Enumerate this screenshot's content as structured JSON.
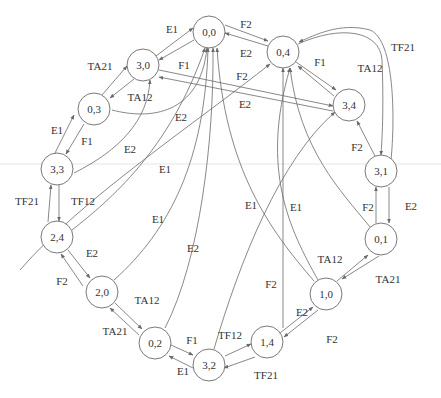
{
  "diagram": {
    "type": "state-transition-graph",
    "node_radius": 16,
    "colors": {
      "stroke": "#6a6a6a",
      "text": "#333333",
      "background": "#ffffff"
    },
    "nodes": [
      {
        "id": "0,0",
        "label": "0,0",
        "x": 209,
        "y": 32
      },
      {
        "id": "0,4",
        "label": "0,4",
        "x": 283,
        "y": 52
      },
      {
        "id": "3,0",
        "label": "3,0",
        "x": 143,
        "y": 65
      },
      {
        "id": "0,3",
        "label": "0,3",
        "x": 94,
        "y": 109
      },
      {
        "id": "3,4",
        "label": "3,4",
        "x": 349,
        "y": 105
      },
      {
        "id": "3,3",
        "label": "3,3",
        "x": 57,
        "y": 169
      },
      {
        "id": "3,1",
        "label": "3,1",
        "x": 381,
        "y": 171
      },
      {
        "id": "2,4",
        "label": "2,4",
        "x": 57,
        "y": 237
      },
      {
        "id": "0,1",
        "label": "0,1",
        "x": 381,
        "y": 239
      },
      {
        "id": "2,0",
        "label": "2,0",
        "x": 102,
        "y": 292
      },
      {
        "id": "1,0",
        "label": "1,0",
        "x": 326,
        "y": 294
      },
      {
        "id": "0,2",
        "label": "0,2",
        "x": 155,
        "y": 343
      },
      {
        "id": "1,4",
        "label": "1,4",
        "x": 267,
        "y": 342
      },
      {
        "id": "3,2",
        "label": "3,2",
        "x": 209,
        "y": 365
      }
    ],
    "edges": [
      {
        "from": "3,0",
        "to": "0,0",
        "label": "E1",
        "path": "M156,56 L193,28",
        "lx": 172,
        "ly": 29
      },
      {
        "from": "0,0",
        "to": "3,0",
        "label": "",
        "path": "M194,40 L159,60"
      },
      {
        "from": "0,0",
        "to": "0,4",
        "label": "F2",
        "path": "M225,25 L268,41",
        "lx": 246,
        "ly": 24
      },
      {
        "from": "0,4",
        "to": "0,0",
        "label": "E2",
        "path": "M268,46 L225,33",
        "lx": 246,
        "ly": 53
      },
      {
        "from": "0,3",
        "to": "3,0",
        "label": "TA21",
        "path": "M102,95 L127,66",
        "lx": 100,
        "ly": 66
      },
      {
        "from": "3,0",
        "to": "0,3",
        "label": "TA12",
        "path": "M134,79 L110,98",
        "lx": 140,
        "ly": 97
      },
      {
        "from": "3,0",
        "to": "3,4",
        "label": "F1",
        "path": "M159,70 L333,106",
        "lx": 184,
        "ly": 65
      },
      {
        "from": "3,4",
        "to": "3,0",
        "label": "E2",
        "path": "M333,111 L159,77",
        "lx": 245,
        "ly": 104
      },
      {
        "from": "0,3",
        "to": "0,0",
        "label": "E2",
        "path": "M112,110 C150,120 200,115 207,48",
        "lx": 181,
        "ly": 117
      },
      {
        "from": "3,3",
        "to": "0,3",
        "label": "E1",
        "path": "M55,153 L74,115",
        "lx": 57,
        "ly": 130
      },
      {
        "from": "0,3",
        "to": "3,3",
        "label": "F1",
        "path": "M84,124 L66,154",
        "lx": 87,
        "ly": 141
      },
      {
        "from": "3,3",
        "to": "3,0",
        "label": "E2",
        "path": "M74,173 C120,150 148,120 150,80",
        "lx": 130,
        "ly": 149
      },
      {
        "from": "0,4",
        "to": "3,4",
        "label": "F1",
        "path": "M296,62 L336,90",
        "lx": 320,
        "ly": 62
      },
      {
        "from": "3,4",
        "to": "0,4",
        "label": "",
        "path": "M334,96 L298,66"
      },
      {
        "from": "2,0",
        "to": "0,4",
        "label": "F2",
        "path": "M20,270 C80,200 200,120 270,64",
        "lx": 242,
        "ly": 76
      },
      {
        "from": "0,4",
        "to": "3,1",
        "label": "TA12",
        "path": "M298,44 C340,25 380,30 382,60 C384,110 382,140 381,155",
        "lx": 370,
        "ly": 68
      },
      {
        "from": "3,1",
        "to": "0,4",
        "label": "TF21",
        "path": "M391,160 C395,120 395,40 370,30 C340,22 315,35 299,42",
        "lx": 403,
        "ly": 47
      },
      {
        "from": "3,1",
        "to": "3,4",
        "label": "F2",
        "path": "M375,156 L357,121",
        "lx": 357,
        "ly": 147
      },
      {
        "from": "2,4",
        "to": "0,0",
        "label": "E1",
        "path": "M72,230 C110,200 170,150 205,48",
        "lx": 165,
        "ly": 169
      },
      {
        "from": "2,0",
        "to": "0,0",
        "label": "E1",
        "path": "M114,280 C170,230 205,160 208,48",
        "lx": 158,
        "ly": 219
      },
      {
        "from": "0,2",
        "to": "0,0",
        "label": "E2",
        "path": "M165,328 C200,260 214,140 213,48",
        "lx": 193,
        "ly": 248
      },
      {
        "from": "3,2",
        "to": "3,4",
        "label": "F2",
        "path": "M214,349 C240,260 280,160 335,112",
        "lx": 271,
        "ly": 284
      },
      {
        "from": "1,4",
        "to": "0,4",
        "label": "E1",
        "path": "M283,328 L283,68",
        "lx": 296,
        "ly": 207
      },
      {
        "from": "1,0",
        "to": "0,4",
        "label": "E1",
        "path": "M318,280 C290,230 260,170 290,68",
        "lx": 251,
        "ly": 205
      },
      {
        "from": "1,0",
        "to": "0,0",
        "label": "",
        "path": "M314,281 C270,230 225,170 217,48"
      },
      {
        "from": "0,1",
        "to": "0,4",
        "label": "F2",
        "path": "M370,227 C340,190 300,150 290,68",
        "lx": 368,
        "ly": 207
      },
      {
        "from": "3,1",
        "to": "0,1",
        "label": "E2",
        "path": "M389,187 L389,223",
        "lx": 411,
        "ly": 206
      },
      {
        "from": "0,1",
        "to": "3,1",
        "label": "",
        "path": "M376,223 L376,187"
      },
      {
        "from": "1,0",
        "to": "0,1",
        "label": "TA12",
        "path": "M337,281 L368,255",
        "lx": 330,
        "ly": 259
      },
      {
        "from": "0,1",
        "to": "1,0",
        "label": "TA21",
        "path": "M379,256 L342,279",
        "lx": 388,
        "ly": 279
      },
      {
        "from": "1,4",
        "to": "1,0",
        "label": "E2",
        "path": "M280,333 L313,307",
        "lx": 302,
        "ly": 312
      },
      {
        "from": "1,0",
        "to": "1,4",
        "label": "F2",
        "path": "M318,310 L284,337",
        "lx": 332,
        "ly": 339
      },
      {
        "from": "3,2",
        "to": "1,4",
        "label": "TF12",
        "path": "M225,356 L251,344",
        "lx": 230,
        "ly": 335
      },
      {
        "from": "1,4",
        "to": "3,2",
        "label": "TF21",
        "path": "M255,357 L224,368",
        "lx": 266,
        "ly": 375
      },
      {
        "from": "0,2",
        "to": "3,2",
        "label": "F1",
        "path": "M171,345 L193,355",
        "lx": 192,
        "ly": 340
      },
      {
        "from": "3,2",
        "to": "0,2",
        "label": "E1",
        "path": "M193,368 L169,356",
        "lx": 183,
        "ly": 371
      },
      {
        "from": "2,0",
        "to": "0,2",
        "label": "TA12",
        "path": "M115,303 L142,329",
        "lx": 147,
        "ly": 300
      },
      {
        "from": "0,2",
        "to": "2,0",
        "label": "TA21",
        "path": "M139,335 L110,308",
        "lx": 115,
        "ly": 331
      },
      {
        "from": "2,4",
        "to": "2,0",
        "label": "E2",
        "path": "M68,250 L90,278",
        "lx": 92,
        "ly": 253
      },
      {
        "from": "2,0",
        "to": "2,4",
        "label": "F2",
        "path": "M83,286 L61,254",
        "lx": 62,
        "ly": 281
      },
      {
        "from": "3,3",
        "to": "2,4",
        "label": "TF12",
        "path": "M59,185 L59,221",
        "lx": 83,
        "ly": 201
      },
      {
        "from": "2,4",
        "to": "3,3",
        "label": "TF21",
        "path": "M48,222 L51,185",
        "lx": 27,
        "ly": 201
      }
    ]
  },
  "separator_line": {
    "y": 164
  },
  "caption": {
    "text": ""
  }
}
